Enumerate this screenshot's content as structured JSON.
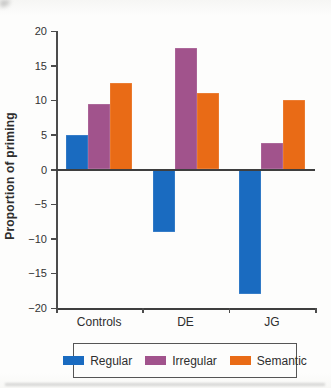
{
  "figure": {
    "background": "#fdfdfc",
    "axis_color": "#4c4c4c"
  },
  "chart_data": {
    "type": "bar",
    "title": "",
    "categories": [
      "Controls",
      "DE",
      "JG"
    ],
    "series": [
      {
        "name": "Regular",
        "color": "#1a6bc0",
        "values": [
          5,
          -9,
          -18
        ]
      },
      {
        "name": "Irregular",
        "color": "#a1538c",
        "values": [
          9.5,
          17.5,
          3.8
        ]
      },
      {
        "name": "Semantic",
        "color": "#e96b16",
        "values": [
          12.5,
          11,
          10
        ]
      }
    ],
    "xlabel": "",
    "ylabel": "Proportion of priming",
    "ylim": [
      -20,
      20
    ],
    "yticks": [
      20,
      15,
      10,
      5,
      0,
      -5,
      -10,
      -15,
      -20
    ],
    "grid": false,
    "zero_line": true,
    "legend_position": "bottom"
  }
}
